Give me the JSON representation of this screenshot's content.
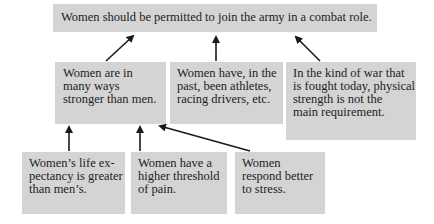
{
  "diagram": {
    "type": "argument-map",
    "conclusion": {
      "text": "Women should be permitted to join the army in a combat role."
    },
    "premises": [
      {
        "id": "a",
        "lines": [
          "Women are in",
          "many ways",
          "stronger than men."
        ],
        "supports": "conclusion"
      },
      {
        "id": "b",
        "lines": [
          "Women have, in the",
          "past, been athletes,",
          "racing drivers, etc."
        ],
        "supports": "conclusion"
      },
      {
        "id": "c",
        "lines": [
          "In the kind of war that",
          "is fought today, physical",
          "strength is not the",
          "main requirement."
        ],
        "supports": "conclusion"
      }
    ],
    "sub_premises": [
      {
        "id": "d",
        "lines": [
          "Women’s life ex-",
          "pectancy is greater",
          "than men’s."
        ],
        "supports": "a"
      },
      {
        "id": "e",
        "lines": [
          "Women have a",
          "higher threshold",
          "of pain."
        ],
        "supports": "a"
      },
      {
        "id": "f",
        "lines": [
          "Women",
          "respond better",
          "to stress."
        ],
        "supports": "a"
      }
    ],
    "colors": {
      "box_fill": "#d4d4d4",
      "arrow": "#1a1a1a",
      "text": "#222222"
    }
  }
}
